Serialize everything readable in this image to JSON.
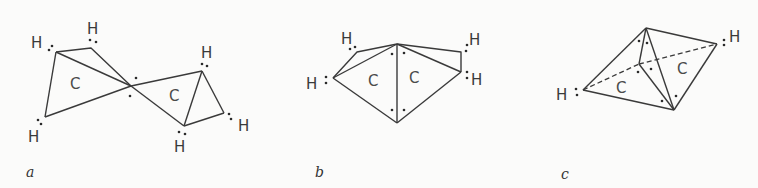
{
  "figure": {
    "panels": [
      {
        "label": "a",
        "carbons": [
          "C",
          "C"
        ],
        "hydrogens": [
          "H",
          "H",
          "H",
          "H",
          "H",
          "H"
        ]
      },
      {
        "label": "b",
        "carbons": [
          "C",
          "C"
        ],
        "hydrogens": [
          "H",
          "H",
          "H",
          "H"
        ]
      },
      {
        "label": "c",
        "carbons": [
          "C",
          "C"
        ],
        "hydrogens": [
          "H",
          "H"
        ]
      }
    ]
  }
}
